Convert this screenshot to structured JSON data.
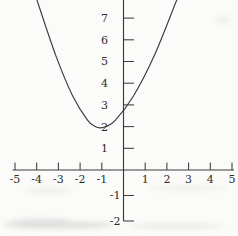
{
  "figure": {
    "kind": "scanned grayscale textbook graph of a quadratic function",
    "background_color": "#fbfbfa",
    "ink_color": "#3c3c3c",
    "label_color": "#2f2f2f"
  },
  "chart_data": {
    "type": "line",
    "title": "",
    "xlabel": "",
    "ylabel": "",
    "xlim": [
      -5,
      5
    ],
    "ylim": [
      -2,
      8
    ],
    "grid": false,
    "legend": false,
    "axes_style": "cross at origin, ticks above x-axis and right of y-axis, serif numeral labels",
    "x_ticks": [
      {
        "v": -5,
        "label": "-5"
      },
      {
        "v": -4,
        "label": "-4"
      },
      {
        "v": -3,
        "label": "-3"
      },
      {
        "v": -2,
        "label": "-2"
      },
      {
        "v": -1,
        "label": "-1"
      },
      {
        "v": 1,
        "label": "1"
      },
      {
        "v": 2,
        "label": "2"
      },
      {
        "v": 3,
        "label": "3"
      },
      {
        "v": 4,
        "label": "4"
      },
      {
        "v": 5,
        "label": "5"
      }
    ],
    "y_ticks": [
      {
        "v": -2,
        "label": "-2"
      },
      {
        "v": -1,
        "label": "-1"
      },
      {
        "v": 1,
        "label": "1"
      },
      {
        "v": 2,
        "label": "2"
      },
      {
        "v": 3,
        "label": "3"
      },
      {
        "v": 4,
        "label": "4"
      },
      {
        "v": 5,
        "label": "5"
      },
      {
        "v": 6,
        "label": "6"
      },
      {
        "v": 7,
        "label": "7"
      },
      {
        "v": 8,
        "label": "8",
        "clipped_at_top_edge": true
      }
    ],
    "series": [
      {
        "name": "parabola",
        "description": "upward-opening parabola; vertex near (-1.1, 1.95); crosses y-axis near y = 2.75; rises past the top edge near x = -4 and x = 2.5",
        "points": [
          [
            -4.01,
            7.9
          ],
          [
            -3.11,
            5.25
          ],
          [
            -2.34,
            3.41
          ],
          [
            -1.66,
            2.3
          ],
          [
            -1.3,
            2.0
          ],
          [
            -1.08,
            1.94
          ],
          [
            -0.81,
            2.0
          ],
          [
            -0.37,
            2.3
          ],
          [
            0.46,
            3.41
          ],
          [
            1.41,
            5.25
          ],
          [
            2.48,
            7.9
          ]
        ]
      }
    ]
  }
}
